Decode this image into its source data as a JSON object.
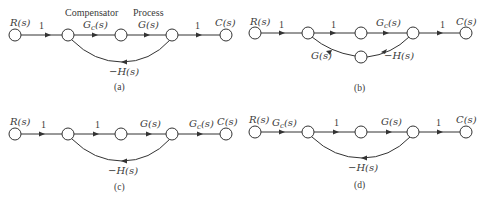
{
  "diagrams": [
    {
      "id": "a",
      "caption": "(a)",
      "input": "R(s)",
      "output": "C(s)",
      "branches": [
        {
          "from": 0,
          "to": 1,
          "gain": "1"
        },
        {
          "from": 1,
          "to": 2,
          "gain": "Gc(s)",
          "header": "Compensator"
        },
        {
          "from": 2,
          "to": 3,
          "gain": "G(s)",
          "header": "Process"
        },
        {
          "from": 3,
          "to": 4,
          "gain": "1"
        },
        {
          "from": 3,
          "to": 1,
          "gain": "−H(s)",
          "type": "feedback"
        }
      ],
      "labels": {
        "in": "R(s)",
        "b1": "1",
        "hdr1": "Compensator",
        "b2_main": "G",
        "b2_sub": "c",
        "b2_tail": "(s)",
        "hdr2": "Process",
        "b3": "G(s)",
        "b4": "1",
        "out": "C(s)",
        "fb": "−H(s)"
      }
    },
    {
      "id": "b",
      "caption": "(b)",
      "input": "R(s)",
      "output": "C(s)",
      "branches": [
        {
          "from": 0,
          "to": 1,
          "gain": "1"
        },
        {
          "from": 1,
          "to": 2,
          "gain": "1"
        },
        {
          "from": 2,
          "to": 3,
          "gain": "Gc(s)"
        },
        {
          "from": 3,
          "to": 4,
          "gain": "1"
        },
        {
          "from": 3,
          "to": 5,
          "gain": "−H(s)"
        },
        {
          "from": 5,
          "to": 1,
          "gain": "G(s)"
        }
      ],
      "labels": {
        "in": "R(s)",
        "b1": "1",
        "b2": "1",
        "b3_main": "G",
        "b3_sub": "c",
        "b3_tail": "(s)",
        "b4": "1",
        "out": "C(s)",
        "lower_left": "G(s)",
        "lower_right": "−H(s)"
      }
    },
    {
      "id": "c",
      "caption": "(c)",
      "input": "R(s)",
      "output": "C(s)",
      "branches": [
        {
          "from": 0,
          "to": 1,
          "gain": "1"
        },
        {
          "from": 1,
          "to": 2,
          "gain": "1"
        },
        {
          "from": 2,
          "to": 3,
          "gain": "G(s)"
        },
        {
          "from": 3,
          "to": 4,
          "gain": "Gc(s)"
        },
        {
          "from": 3,
          "to": 1,
          "gain": "−H(s)",
          "type": "feedback"
        }
      ],
      "labels": {
        "in": "R(s)",
        "b1": "1",
        "b2": "1",
        "b3": "G(s)",
        "b4_main": "G",
        "b4_sub": "c",
        "b4_tail": "(s)",
        "out": "C(s)",
        "fb": "−H(s)"
      }
    },
    {
      "id": "d",
      "caption": "(d)",
      "input": "R(s)",
      "output": "C(s)",
      "branches": [
        {
          "from": 0,
          "to": 1,
          "gain": "Gc(s)"
        },
        {
          "from": 1,
          "to": 2,
          "gain": "1"
        },
        {
          "from": 2,
          "to": 3,
          "gain": "G(s)"
        },
        {
          "from": 3,
          "to": 4,
          "gain": "1"
        },
        {
          "from": 3,
          "to": 1,
          "gain": "−H(s)",
          "type": "feedback"
        }
      ],
      "labels": {
        "in": "R(s)",
        "b1_main": "G",
        "b1_sub": "c",
        "b1_tail": "(s)",
        "b2": "1",
        "b3": "G(s)",
        "b4": "1",
        "out": "C(s)",
        "fb": "−H(s)"
      }
    }
  ]
}
